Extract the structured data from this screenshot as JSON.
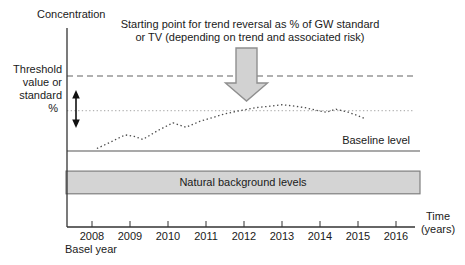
{
  "figure": {
    "x_axis_title": "Time\n(years)",
    "threshold_label": "Threshold\nvalue or\nstandard",
    "percent_label": "%",
    "annotation": "Starting point for trend reversal as % of GW standard\nor TV (depending on trend and associated risk)",
    "basel_year_label": "Basel year"
  },
  "colors": {
    "axis": "#333333",
    "text": "#1a1a1a",
    "threshold_line": "#979797",
    "reversal_line": "#b5b5b5",
    "trend_curve": "#4a4a4a",
    "baseline_line": "#8c8c8c",
    "band_fill": "#d4d4d4",
    "band_border": "#7f7f7f",
    "arrow_fill": "#d2d2d2",
    "arrow_border": "#8f8f8f",
    "double_arrow": "#111111"
  },
  "chart_data": {
    "type": "line",
    "title": "",
    "xlabel": "Time (years)",
    "ylabel": "Concentration",
    "x_ticks": [
      "2008",
      "2009",
      "2010",
      "2011",
      "2012",
      "2013",
      "2014",
      "2015",
      "2016"
    ],
    "x_extra_label": "Basel year",
    "units": "relative concentration, threshold value = 1.0 (y values estimated from figure)",
    "xlim": [
      2007.3,
      2016.5
    ],
    "ylim": [
      0,
      1.32
    ],
    "series": [
      {
        "name": "Measured concentration trend (dotted curve)",
        "style": "dotted",
        "points": [
          [
            2008.13,
            0.52
          ],
          [
            2008.47,
            0.56
          ],
          [
            2008.87,
            0.61
          ],
          [
            2009.11,
            0.6
          ],
          [
            2009.34,
            0.58
          ],
          [
            2009.74,
            0.64
          ],
          [
            2010.13,
            0.69
          ],
          [
            2010.47,
            0.66
          ],
          [
            2010.84,
            0.7
          ],
          [
            2011.24,
            0.73
          ],
          [
            2011.5,
            0.75
          ],
          [
            2011.89,
            0.77
          ],
          [
            2012.29,
            0.79
          ],
          [
            2012.68,
            0.8
          ],
          [
            2013.0,
            0.81
          ],
          [
            2013.34,
            0.8
          ],
          [
            2013.61,
            0.79
          ],
          [
            2013.95,
            0.77
          ],
          [
            2014.16,
            0.76
          ],
          [
            2014.42,
            0.78
          ],
          [
            2014.74,
            0.76
          ],
          [
            2014.97,
            0.74
          ],
          [
            2015.16,
            0.72
          ]
        ]
      }
    ],
    "reference_lines": [
      {
        "id": "threshold-line",
        "label": "Threshold value or standard",
        "style": "dashed",
        "value": 1.0
      },
      {
        "id": "reversal-line",
        "label": "Starting point for trend reversal (% of GW standard or TV)",
        "style": "dotted",
        "value": 0.77
      },
      {
        "id": "baseline-line",
        "label": "Baseline level",
        "style": "solid",
        "value": 0.503
      }
    ],
    "bands": [
      {
        "label": "Natural background levels",
        "from": 0.22,
        "to": 0.37
      }
    ],
    "annotations": [
      {
        "text": "Starting point for trend reversal as % of GW standard or TV (depending on trend and associated risk)",
        "points_to_year": 2012.1
      }
    ]
  }
}
